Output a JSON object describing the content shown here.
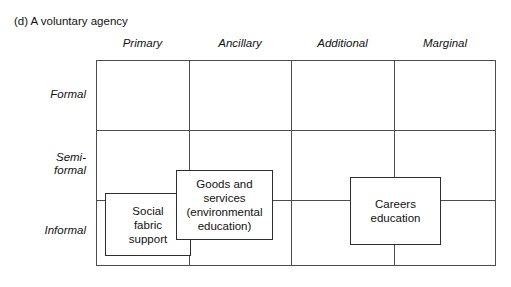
{
  "figure": {
    "caption": "(d) A voluntary agency",
    "columns": [
      {
        "label": "Primary"
      },
      {
        "label": "Ancillary"
      },
      {
        "label": "Additional"
      },
      {
        "label": "Marginal"
      }
    ],
    "rows": [
      {
        "label": "Formal"
      },
      {
        "label": "Semi-\nformal"
      },
      {
        "label": "Informal"
      }
    ],
    "boxes": [
      {
        "id": "social-fabric-support",
        "label": "Social\nfabric\nsupport"
      },
      {
        "id": "goods-and-services",
        "label": "Goods and\nservices\n(environmental\neducation)"
      },
      {
        "id": "careers-education",
        "label": "Careers\neducation"
      }
    ],
    "colors": {
      "background": "#ffffff",
      "grid_line": "#4d4d4d",
      "box_border": "#2e2e2e",
      "text": "#111111"
    }
  }
}
